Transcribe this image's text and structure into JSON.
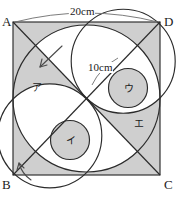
{
  "figure": {
    "kind": "geometry-diagram",
    "description_title": "Square with inscribed circles and diagonals",
    "background_color": "#ffffff",
    "stroke_color": "#2b2b2b",
    "shade_color": "#cfcfcf",
    "square": {
      "side_label": "20cm",
      "vertices": [
        {
          "name": "A",
          "label": "A",
          "position": "top-left"
        },
        {
          "name": "D",
          "label": "D",
          "position": "top-right"
        },
        {
          "name": "B",
          "label": "B",
          "position": "bottom-left"
        },
        {
          "name": "C",
          "label": "C",
          "position": "bottom-right"
        }
      ]
    },
    "dimensions": [
      {
        "name": "square-side",
        "label": "20cm",
        "unit": "cm",
        "value": 20
      },
      {
        "name": "inner-circle-diameter",
        "label": "10cm",
        "unit": "cm",
        "value": 10
      }
    ],
    "regions": [
      {
        "name": "region-a",
        "label": "ア",
        "shaded": true
      },
      {
        "name": "region-i",
        "label": "イ",
        "shaded": true
      },
      {
        "name": "region-u",
        "label": "ウ",
        "shaded": true
      },
      {
        "name": "region-e",
        "label": "エ",
        "shaded": true
      }
    ],
    "annotations": [
      {
        "name": "arrow-upper-left",
        "points": "down-left"
      },
      {
        "name": "arrow-lower-left",
        "points": "up-right"
      }
    ]
  }
}
